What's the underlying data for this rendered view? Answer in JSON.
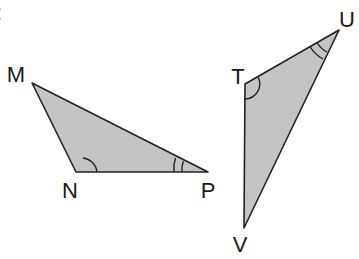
{
  "diagram": {
    "type": "similar-triangles",
    "colors": {
      "fill": "#c4c4c4",
      "stroke": "#222222",
      "label": "#1a1a1a"
    },
    "corner_mark": ":",
    "triangles": [
      {
        "name": "MNP",
        "vertices": [
          {
            "label": "M",
            "x": 32,
            "y": 83,
            "lx": 16,
            "ly": 82
          },
          {
            "label": "N",
            "x": 76,
            "y": 172,
            "lx": 70,
            "ly": 198
          },
          {
            "label": "P",
            "x": 208,
            "y": 172,
            "lx": 208,
            "ly": 198
          }
        ],
        "angle_marks": [
          {
            "vertex": "N",
            "arcs": 1
          },
          {
            "vertex": "P",
            "arcs": 2
          }
        ]
      },
      {
        "name": "TUV",
        "vertices": [
          {
            "label": "T",
            "x": 245,
            "y": 84,
            "lx": 238,
            "ly": 84
          },
          {
            "label": "U",
            "x": 339,
            "y": 30,
            "lx": 346,
            "ly": 27
          },
          {
            "label": "V",
            "x": 244,
            "y": 228,
            "lx": 240,
            "ly": 252
          }
        ],
        "angle_marks": [
          {
            "vertex": "T",
            "arcs": 1
          },
          {
            "vertex": "U",
            "arcs": 2
          }
        ]
      }
    ]
  }
}
